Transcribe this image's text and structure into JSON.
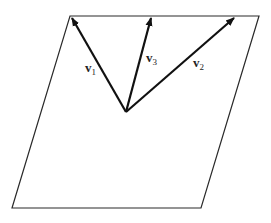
{
  "diagram": {
    "plane_color": "#2a2a2a",
    "vector_color": "#111111",
    "vectors": [
      {
        "name": "v1",
        "base": "v",
        "subscript": "1"
      },
      {
        "name": "v2",
        "base": "v",
        "subscript": "2"
      },
      {
        "name": "v3",
        "base": "v",
        "subscript": "3"
      }
    ]
  }
}
